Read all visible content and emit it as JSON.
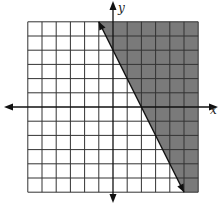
{
  "chart_data": {
    "type": "line",
    "title": "",
    "xlabel": "x",
    "ylabel": "y",
    "xlim": [
      -6,
      6
    ],
    "ylim": [
      -6,
      6
    ],
    "grid": true,
    "grid_step": 1,
    "inequality": "y >= -2x + 4",
    "boundary": {
      "equation": "y = -2x + 4",
      "slope": -2,
      "y_intercept": 4,
      "x_intercept": 2,
      "style": "solid",
      "endpoints": [
        [
          -1,
          6
        ],
        [
          5,
          -6
        ]
      ],
      "arrows": true
    },
    "shaded_region": "above-right of boundary",
    "shade_color": "#7a7a7a",
    "grid_color": "#333333",
    "axis_color": "#111111"
  },
  "labels": {
    "x_axis": "x",
    "y_axis": "y"
  }
}
